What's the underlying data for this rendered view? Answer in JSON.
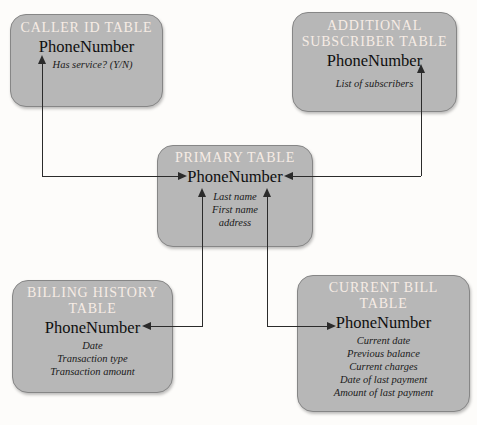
{
  "diagram": {
    "colors": {
      "background": "#fdfcfa",
      "box_fill": "#b7b7b7",
      "box_border": "#868686",
      "title_text": "#f6ece5",
      "key_text": "#0f0f0f",
      "attribute_text": "#1a1a1a",
      "connector_line": "#2b2b2b"
    },
    "tables": [
      {
        "id": "caller-id",
        "title_lines": [
          "CALLER ID TABLE"
        ],
        "key": "PhoneNumber",
        "attributes": [
          "Has service? (Y/N)"
        ]
      },
      {
        "id": "additional-subscriber",
        "title_lines": [
          "ADDITIONAL",
          "SUBSCRIBER TABLE"
        ],
        "key": "PhoneNumber",
        "attributes": [
          "List of subscribers"
        ]
      },
      {
        "id": "primary",
        "title_lines": [
          "PRIMARY TABLE"
        ],
        "key": "PhoneNumber",
        "attributes": [
          "Last name",
          "First name",
          "address"
        ]
      },
      {
        "id": "billing-history",
        "title_lines": [
          "BILLING HISTORY",
          "TABLE"
        ],
        "key": "PhoneNumber",
        "attributes": [
          "Date",
          "Transaction type",
          "Transaction amount"
        ]
      },
      {
        "id": "current-bill",
        "title_lines": [
          "CURRENT BILL",
          "TABLE"
        ],
        "key": "PhoneNumber",
        "attributes": [
          "Current date",
          "Previous balance",
          "Current charges",
          "Date of last payment",
          "Amount of last payment"
        ]
      }
    ],
    "connections": [
      {
        "from": "primary.PhoneNumber",
        "to": "caller-id.PhoneNumber",
        "style": "double-arrow"
      },
      {
        "from": "primary.PhoneNumber",
        "to": "additional-subscriber.PhoneNumber",
        "style": "double-arrow"
      },
      {
        "from": "primary.PhoneNumber",
        "to": "billing-history.PhoneNumber",
        "style": "double-arrow"
      },
      {
        "from": "primary.PhoneNumber",
        "to": "current-bill.PhoneNumber",
        "style": "double-arrow"
      }
    ]
  }
}
